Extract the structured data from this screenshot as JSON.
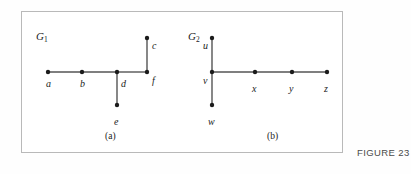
{
  "figure": {
    "number_label": "FIGURE 23",
    "frame": {
      "x": 21,
      "y": 11,
      "width": 322,
      "height": 142,
      "border_color": "#b9b9b9"
    },
    "background_color": "#ffffff",
    "ink_color": "#1b1b1b",
    "edge_color": "#555555"
  },
  "chart_data": {
    "type": "diagram",
    "subtype": "graph-tree",
    "title": "FIGURE 23",
    "graphs": [
      {
        "id": "G1",
        "name": "G",
        "subscript": "1",
        "caption": "(a)",
        "caption_x": 105,
        "caption_y": 131,
        "title_x": 36,
        "title_y": 30,
        "vertices": [
          {
            "id": "a",
            "label": "a",
            "x": 48,
            "y": 72,
            "label_x": 46,
            "label_y": 78,
            "label_anchor": "start"
          },
          {
            "id": "b",
            "label": "b",
            "x": 82,
            "y": 72,
            "label_x": 80,
            "label_y": 78,
            "label_anchor": "start"
          },
          {
            "id": "d",
            "label": "d",
            "x": 117,
            "y": 72,
            "label_x": 121,
            "label_y": 78,
            "label_anchor": "start"
          },
          {
            "id": "f",
            "label": "f",
            "x": 147,
            "y": 72,
            "label_x": 152,
            "label_y": 75,
            "label_anchor": "start"
          },
          {
            "id": "c",
            "label": "c",
            "x": 147,
            "y": 38,
            "label_x": 152,
            "label_y": 40,
            "label_anchor": "start"
          },
          {
            "id": "e",
            "label": "e",
            "x": 117,
            "y": 105,
            "label_x": 114,
            "label_y": 116,
            "label_anchor": "start"
          }
        ],
        "edges": [
          {
            "from": "a",
            "to": "b"
          },
          {
            "from": "b",
            "to": "d"
          },
          {
            "from": "d",
            "to": "f"
          },
          {
            "from": "f",
            "to": "c"
          },
          {
            "from": "d",
            "to": "e"
          }
        ]
      },
      {
        "id": "G2",
        "name": "G",
        "subscript": "2",
        "caption": "(b)",
        "caption_x": 267,
        "caption_y": 131,
        "title_x": 188,
        "title_y": 30,
        "vertices": [
          {
            "id": "u",
            "label": "u",
            "x": 212,
            "y": 38,
            "label_x": 203,
            "label_y": 40,
            "label_anchor": "start"
          },
          {
            "id": "v",
            "label": "v",
            "x": 212,
            "y": 72,
            "label_x": 203,
            "label_y": 75,
            "label_anchor": "start"
          },
          {
            "id": "w",
            "label": "w",
            "x": 212,
            "y": 105,
            "label_x": 208,
            "label_y": 116,
            "label_anchor": "start"
          },
          {
            "id": "x",
            "label": "x",
            "x": 255,
            "y": 72,
            "label_x": 252,
            "label_y": 83,
            "label_anchor": "start"
          },
          {
            "id": "y",
            "label": "y",
            "x": 292,
            "y": 72,
            "label_x": 289,
            "label_y": 83,
            "label_anchor": "start"
          },
          {
            "id": "z",
            "label": "z",
            "x": 327,
            "y": 72,
            "label_x": 324,
            "label_y": 83,
            "label_anchor": "start"
          }
        ],
        "edges": [
          {
            "from": "u",
            "to": "v"
          },
          {
            "from": "v",
            "to": "w"
          },
          {
            "from": "v",
            "to": "x"
          },
          {
            "from": "x",
            "to": "y"
          },
          {
            "from": "y",
            "to": "z"
          }
        ]
      }
    ]
  }
}
